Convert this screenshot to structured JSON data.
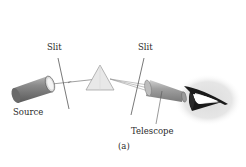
{
  "figure": {
    "caption": "(a)",
    "labels": {
      "slit_left": "Slit",
      "slit_right": "Slit",
      "source": "Source",
      "telescope": "Telescope"
    },
    "components": [
      "source",
      "slit",
      "prism",
      "slit",
      "telescope",
      "eye"
    ],
    "colors": {
      "line": "#555555",
      "cylinder_dark": "#6a6a6a",
      "cylinder_light": "#c8c8c8",
      "prism": "#e4e4e4",
      "eye_glow": "#e2e2e2",
      "text": "#2a2a2a"
    }
  }
}
